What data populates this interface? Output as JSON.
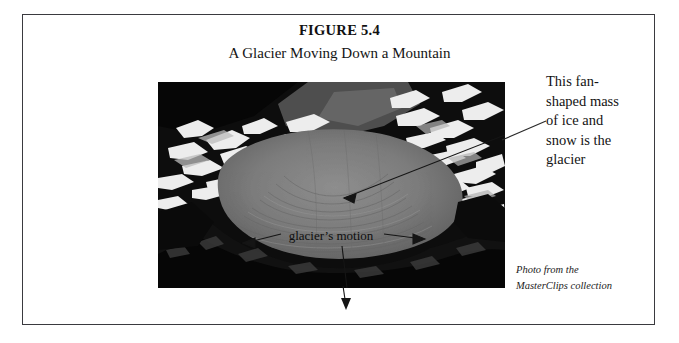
{
  "figure": {
    "title": "FIGURE 5.4",
    "subtitle": "A Glacier Moving Down a Mountain"
  },
  "annotation": {
    "lines": [
      "This fan-",
      "shaped mass",
      "of ice and",
      "snow is the",
      "glacier"
    ]
  },
  "photo": {
    "alt_label": "aerial photograph of a glacier flowing down a mountain valley",
    "in_image_label": "glacier's motion",
    "colors": {
      "sky_dark_rock": "#0d0d0d",
      "snow_highlight": "#f2f2f2",
      "glacier_ice": "#7d7d7d",
      "glacier_ice_light": "#949494",
      "shadow_terrain": "#1d1d1d"
    }
  },
  "credit": {
    "lines": [
      "Photo from the",
      "MasterClips collection"
    ]
  },
  "frame": {
    "border_color": "#3a3a3f"
  }
}
